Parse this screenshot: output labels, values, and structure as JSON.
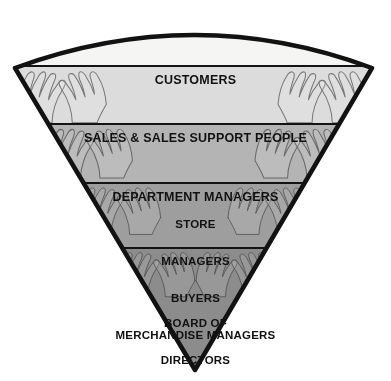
{
  "diagram": {
    "type": "inverted-pyramid",
    "orientation": "inverted",
    "background_color": "#ffffff",
    "outline_color": "#121212",
    "divider_color": "#131313",
    "text_color": "#111111",
    "apex": {
      "x": 195,
      "y": 370
    },
    "top_left": {
      "x": 15,
      "y": 68
    },
    "top_right": {
      "x": 372,
      "y": 68
    },
    "levels": [
      {
        "id": "customers",
        "rank": 1,
        "label": "CUSTOMERS",
        "lines": [
          "CUSTOMERS"
        ],
        "fill": "#f5f5f3",
        "top_y": 12,
        "bottom_y": 66
      },
      {
        "id": "sales",
        "rank": 2,
        "label": "SALES & SALES SUPPORT PEOPLE",
        "lines": [
          "SALES & SALES SUPPORT PEOPLE"
        ],
        "fill": "#dcdcdc",
        "top_y": 66,
        "bottom_y": 124
      },
      {
        "id": "department-managers",
        "rank": 3,
        "label": "DEPARTMENT MANAGERS",
        "lines": [
          "DEPARTMENT MANAGERS"
        ],
        "fill": "#b4b4b4",
        "top_y": 124,
        "bottom_y": 183
      },
      {
        "id": "store-managers",
        "rank": 4,
        "label": "STORE MANAGERS BUYERS MERCHANDISE MANAGERS",
        "lines": [
          "STORE",
          "MANAGERS",
          "BUYERS",
          "MERCHANDISE MANAGERS"
        ],
        "fill": "#9e9e9e",
        "top_y": 183,
        "bottom_y": 248
      },
      {
        "id": "board-of-directors",
        "rank": 5,
        "label": "BOARD OF DIRECTORS",
        "lines": [
          "BOARD OF",
          "DIRECTORS"
        ],
        "fill": "#8c8c8c",
        "top_y": 248,
        "bottom_y": 370
      }
    ],
    "decoration": {
      "name": "raised-hands-illustration",
      "description": "Faint outlined hands reaching upward repeated in pairs across the lower bands"
    }
  }
}
